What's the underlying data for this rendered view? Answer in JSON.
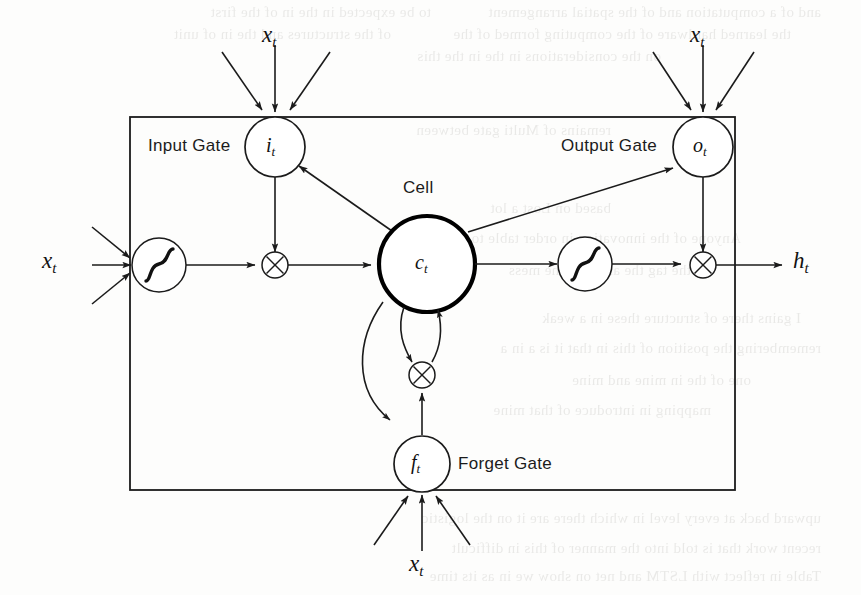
{
  "figure": {
    "type": "lstm-cell-diagram",
    "background_color": "#fdfdfc",
    "line_color": "#1b1b1b",
    "bold_line_color": "#000000"
  },
  "labels": {
    "input_gate": "Input Gate",
    "output_gate": "Output Gate",
    "forget_gate": "Forget Gate",
    "cell": "Cell"
  },
  "nodes": {
    "input_gate_symbol": "i",
    "input_gate_subscript": "t",
    "output_gate_symbol": "o",
    "output_gate_subscript": "t",
    "forget_gate_symbol": "f",
    "forget_gate_subscript": "t",
    "cell_symbol": "c",
    "cell_subscript": "t"
  },
  "io": {
    "input_top_left": "x",
    "input_top_left_sub": "t",
    "input_top_right": "x",
    "input_top_right_sub": "t",
    "input_left": "x",
    "input_left_sub": "t",
    "input_bottom": "x",
    "input_bottom_sub": "t",
    "output_right": "h",
    "output_right_sub": "t"
  },
  "operators": {
    "multiply_glyph": "×",
    "squash_glyph": "sigmoid-curve"
  },
  "ghost_text": {
    "note": "faint show-through text from the reverse of the scanned page",
    "lines": [
      {
        "x": 40,
        "y": 4,
        "text": "and of a computation and of the spatial arrangement"
      },
      {
        "x": 430,
        "y": 4,
        "text": "to be expected in the in of the first"
      },
      {
        "x": 70,
        "y": 26,
        "text": "the learned hardware of the computing formed of the"
      },
      {
        "x": 470,
        "y": 26,
        "text": "of the structures and the in of unit"
      },
      {
        "x": 200,
        "y": 48,
        "text": "on the considerations in the in the this"
      },
      {
        "x": 250,
        "y": 122,
        "text": "remains of Multi gate  between"
      },
      {
        "x": 250,
        "y": 200,
        "text": "based on Lost a lot"
      },
      {
        "x": 120,
        "y": 230,
        "text": "Anyone of the innovation  in order table to"
      },
      {
        "x": 170,
        "y": 262,
        "text": "the tag  the  are time the mess"
      },
      {
        "x": 60,
        "y": 310,
        "text": "I  gains there  of  structure  these  in  a  weak"
      },
      {
        "x": 40,
        "y": 340,
        "text": "remembering    the  position  of  this  in  that  it  is  a  in  a"
      },
      {
        "x": 110,
        "y": 372,
        "text": "one of the in mine and mine"
      },
      {
        "x": 150,
        "y": 402,
        "text": "mapping  in    introduce  of  that  mine"
      },
      {
        "x": 40,
        "y": 510,
        "text": "upward back  at  every  level  in  which  there  are  it  on  the  logistic"
      },
      {
        "x": 40,
        "y": 540,
        "text": "recent  work  that  is  told  into  the  manner  of  this  in  difficult"
      },
      {
        "x": 40,
        "y": 568,
        "text": "Table  in  reflect  with  LSTM  and  net  on  show  we  in  as  its  time"
      }
    ]
  }
}
